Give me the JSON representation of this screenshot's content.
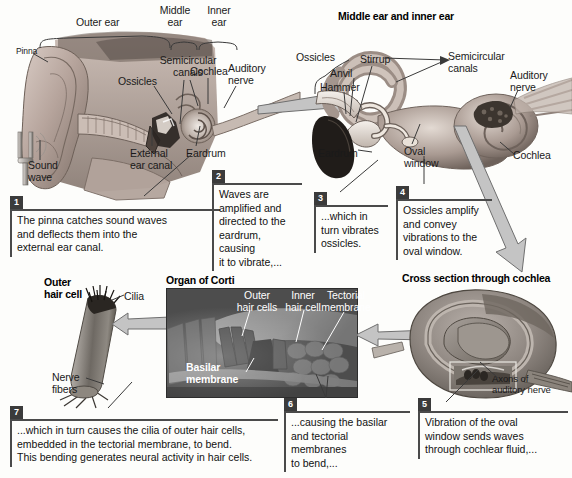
{
  "figure": {
    "type": "anatomical-diagram"
  },
  "panels": {
    "whole_ear": {
      "brackets": [
        {
          "label": "Outer ear"
        },
        {
          "label": "Middle\near"
        },
        {
          "label": "Inner\near"
        }
      ],
      "labels": [
        {
          "name": "pinna",
          "text": "Pinna"
        },
        {
          "name": "sound-wave",
          "text": "Sound\nwave"
        },
        {
          "name": "ossicles",
          "text": "Ossicles"
        },
        {
          "name": "semicircular-canals",
          "text": "Semicircular\ncanals"
        },
        {
          "name": "cochlea",
          "text": "Cochlea"
        },
        {
          "name": "auditory-nerve",
          "text": "Auditory\nnerve"
        },
        {
          "name": "external-ear-canal",
          "text": "External\near canal"
        },
        {
          "name": "eardrum",
          "text": "Eardrum"
        }
      ]
    },
    "middle_inner": {
      "title": "Middle ear and inner ear",
      "labels": [
        {
          "name": "ossicles",
          "text": "Ossicles"
        },
        {
          "name": "stirrup",
          "text": "Stirrup"
        },
        {
          "name": "anvil",
          "text": "Anvil"
        },
        {
          "name": "hammer",
          "text": "Hammer"
        },
        {
          "name": "semicircular-canals",
          "text": "Semicircular\ncanals"
        },
        {
          "name": "auditory-nerve",
          "text": "Auditory\nnerve"
        },
        {
          "name": "eardrum",
          "text": "Eardrum"
        },
        {
          "name": "oval-window",
          "text": "Oval\nwindow"
        },
        {
          "name": "cochlea",
          "text": "Cochlea"
        }
      ]
    },
    "outer_hair_cell": {
      "title": "Outer\nhair cell",
      "labels": [
        {
          "name": "cilia",
          "text": "Cilia"
        },
        {
          "name": "nerve-fibers",
          "text": "Nerve\nfibers"
        }
      ]
    },
    "organ_of_corti": {
      "title": "Organ of Corti",
      "labels": [
        {
          "name": "outer-hair-cells",
          "text": "Outer\nhair cells"
        },
        {
          "name": "inner-hair-cell",
          "text": "Inner\nhair cell"
        },
        {
          "name": "tectorial-membrane",
          "text": "Tectorial\nmembrane"
        },
        {
          "name": "basilar-membrane",
          "text": "Basilar\nmembrane"
        }
      ]
    },
    "cochlea_cross_section": {
      "title": "Cross section through cochlea",
      "labels": [
        {
          "name": "axons-of-auditory-nerve",
          "text": "Axons of\nauditory nerve"
        }
      ]
    }
  },
  "steps": [
    {
      "num": "1",
      "text": "The pinna catches sound waves\nand deflects them into the\nexternal ear canal."
    },
    {
      "num": "2",
      "text": "Waves are\namplified and\ndirected to the\neardrum, causing\nit to vibrate,..."
    },
    {
      "num": "3",
      "text": "...which in\nturn vibrates\nossicles."
    },
    {
      "num": "4",
      "text": "Ossicles amplify\nand convey\nvibrations to the\noval window."
    },
    {
      "num": "5",
      "text": "Vibration of the oval\nwindow sends waves\nthrough cochlear fluid,..."
    },
    {
      "num": "6",
      "text": "...causing the basilar\nand tectorial membranes\nto bend,..."
    },
    {
      "num": "7",
      "text": "...which in turn causes the cilia of outer hair cells,\nembedded in the tectorial membrane, to bend.\nThis bending generates neural activity in hair cells."
    }
  ],
  "colors": {
    "page_background": "#fdfdfb",
    "caption_rule": "#4a4a4a",
    "caption_number_box": "#3b3b3b",
    "flow_arrow": "#b9b9b9",
    "flow_arrow_outline": "#6a6a6a",
    "tissue_light": "#c8b9b2",
    "tissue_mid": "#9d8d86",
    "tissue_dark": "#5d5149",
    "micrograph_dark": "#4d4d4d"
  }
}
